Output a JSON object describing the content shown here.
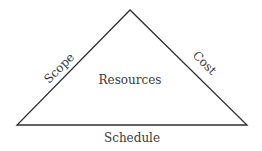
{
  "diagram": {
    "type": "triangle",
    "edges": {
      "left": "Scope",
      "right": "Cost",
      "bottom": "Schedule"
    },
    "center": "Resources",
    "colors": {
      "line": "#2e2e2e",
      "text": "#3a3a3a",
      "background": "#ffffff"
    }
  }
}
